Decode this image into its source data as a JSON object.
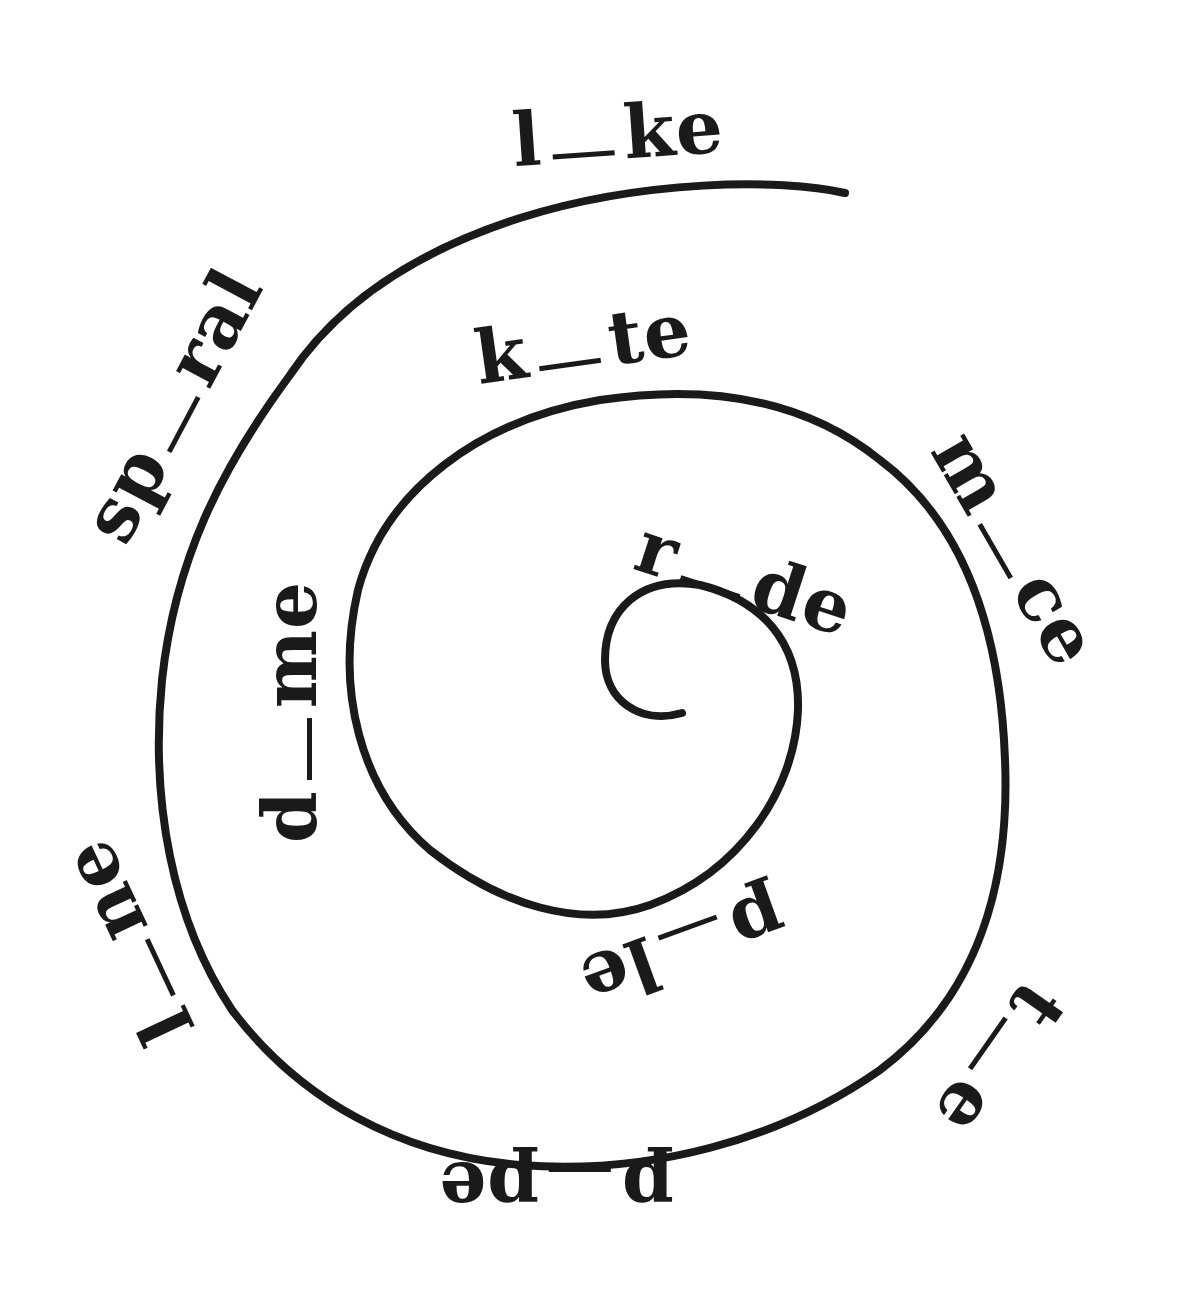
{
  "worksheet": {
    "theme": "missing letter i spiral",
    "ink_color": "#1a1a1a",
    "background_color": "#ffffff",
    "words": [
      {
        "id": "like",
        "before": "l",
        "after": "ke",
        "x": 618,
        "y": 133,
        "rotate": -4
      },
      {
        "id": "spiral",
        "before": "sp",
        "after": "ral",
        "x": 172,
        "y": 405,
        "rotate": -62
      },
      {
        "id": "kite",
        "before": "k",
        "after": "te",
        "x": 583,
        "y": 343,
        "rotate": -8
      },
      {
        "id": "mice",
        "before": "m",
        "after": "ce",
        "x": 1016,
        "y": 548,
        "rotate": 60
      },
      {
        "id": "ride",
        "before": "r",
        "after": "de",
        "x": 745,
        "y": 578,
        "rotate": 18
      },
      {
        "id": "dime",
        "before": "d",
        "after": "me",
        "x": 290,
        "y": 712,
        "rotate": -90
      },
      {
        "id": "pile",
        "before": "p",
        "after": "le",
        "x": 683,
        "y": 950,
        "rotate": 160
      },
      {
        "id": "tie",
        "before": "t",
        "after": "e",
        "x": 1000,
        "y": 1060,
        "rotate": 125
      },
      {
        "id": "pipe",
        "before": "p",
        "after": "pe",
        "x": 556,
        "y": 1189,
        "rotate": 180
      },
      {
        "id": "line",
        "before": "l",
        "after": "ne",
        "x": 127,
        "y": 942,
        "rotate": -115
      }
    ],
    "spiral": {
      "stroke_width": 8,
      "outer_end": [
        845,
        193
      ],
      "inner_end": [
        682,
        713
      ]
    }
  }
}
